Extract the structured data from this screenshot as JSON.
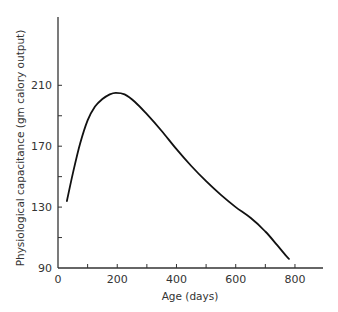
{
  "chart_data": {
    "type": "line",
    "title": "",
    "xlabel": "Age (days)",
    "ylabel": "Physiological capacitance (gm calory output)",
    "xlim": [
      0,
      900
    ],
    "ylim": [
      90,
      255
    ],
    "x_ticks_major": [
      0,
      200,
      400,
      600,
      800
    ],
    "x_ticks_minor": [
      100,
      300,
      500,
      700
    ],
    "y_ticks_major": [
      90,
      130,
      170,
      210
    ],
    "y_ticks_minor": [
      110,
      150,
      190
    ],
    "grid": false,
    "legend": null,
    "series": [
      {
        "name": "Physiological capacitance",
        "color": "#111111",
        "x": [
          30,
          50,
          75,
          100,
          125,
          150,
          175,
          195,
          225,
          260,
          300,
          350,
          400,
          450,
          500,
          550,
          600,
          650,
          700,
          740,
          770,
          780
        ],
        "y": [
          134,
          152,
          172,
          187,
          196,
          201,
          204,
          205,
          204,
          199,
          191,
          180,
          168,
          157,
          147,
          138,
          130,
          123,
          114,
          105,
          98,
          96
        ]
      }
    ]
  }
}
